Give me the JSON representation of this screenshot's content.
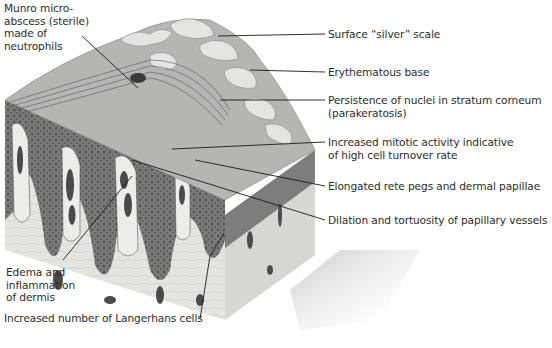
{
  "figure": {
    "labels": {
      "munro": [
        "Munro micro-",
        "abscess (sterile)",
        "made of",
        "neutrophils"
      ],
      "surface_scale": "Surface “silver” scale",
      "erythematous": "Erythematous base",
      "parakeratosis": [
        "Persistence of nuclei in stratum corneum",
        "(parakeratosis)"
      ],
      "mitotic": [
        "Increased mitotic activity indicative",
        "of high cell turnover rate"
      ],
      "rete_pegs": "Elongated rete pegs and dermal papillae",
      "vessels": "Dilation and tortuosity of papillary vessels",
      "edema": [
        "Edema and",
        "inflammation",
        "of dermis"
      ],
      "langerhans": "Increased number of Langerhans cells"
    },
    "colors": {
      "epidermis": "#6f6f6f",
      "dermis": "#e2e2de",
      "scale": "#d9d9d6",
      "vessel": "#4a4a4a",
      "leader_line": "#1a1a1a"
    }
  }
}
